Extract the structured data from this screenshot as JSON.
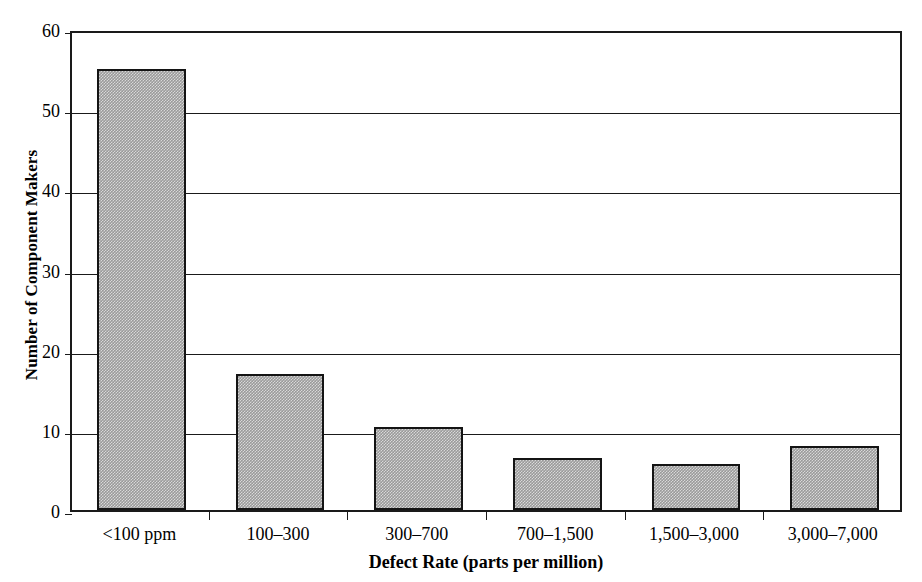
{
  "chart_data": {
    "type": "bar",
    "title": "",
    "xlabel": "Defect Rate (parts per million)",
    "ylabel": "Number of Component Makers",
    "categories": [
      "<100 ppm",
      "100–300",
      "300–700",
      "700–1,500",
      "1,500–3,000",
      "3,000–7,000"
    ],
    "values": [
      55,
      17,
      10.3,
      6.5,
      5.7,
      8
    ],
    "ylim": [
      0,
      60
    ],
    "yticks": [
      0,
      10,
      20,
      30,
      40,
      50,
      60
    ],
    "ytick_labels": [
      "0",
      "10",
      "20",
      "30",
      "40",
      "50",
      "60"
    ],
    "xlim_categorical": true,
    "grid": "horizontal",
    "legend": "none",
    "bar_fill_color": "#9a9a9a",
    "bar_edge_color": "#141414",
    "axis_color": "#1a1a1a",
    "background_color": "#ffffff"
  },
  "axes": {
    "y_title": "Number of Component Makers",
    "x_title": "Defect Rate (parts per million)"
  }
}
